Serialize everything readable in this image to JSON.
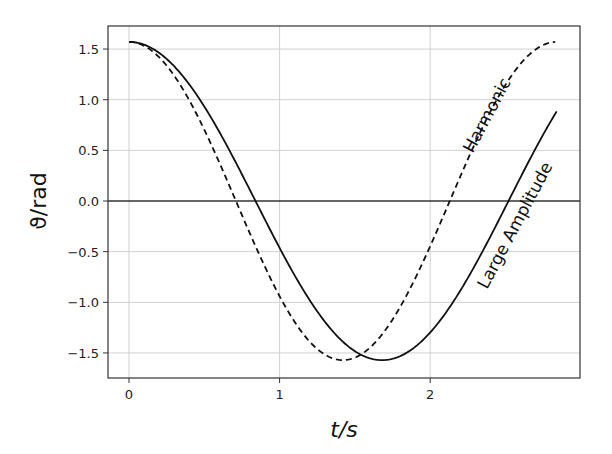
{
  "chart_data": {
    "type": "line",
    "title": "",
    "xlabel": "t/s",
    "ylabel": "ϑ/rad",
    "xlim": [
      -0.14,
      3.0
    ],
    "ylim": [
      -1.73,
      1.73
    ],
    "xticks": [
      0,
      1,
      2
    ],
    "xtick_labels": [
      "0",
      "1",
      "2"
    ],
    "yticks": [
      1.5,
      1.0,
      0.5,
      0.0,
      -0.5,
      -1.0,
      -1.5
    ],
    "ytick_labels": [
      "1.5",
      "1.0",
      "0.5",
      "0.0",
      "−0.5",
      "−1.0",
      "−1.5"
    ],
    "grid": true,
    "legend": "none (inline curve labels)",
    "annotations": [
      {
        "text": "Harmonic",
        "rotation_deg": -62,
        "near_series": "Harmonic"
      },
      {
        "text": "Large Amplitude",
        "rotation_deg": -62,
        "near_series": "Large Amplitude"
      }
    ],
    "horizontal_line": {
      "y": 0.0,
      "style": "solid"
    },
    "series": [
      {
        "name": "Harmonic",
        "style": "dashed",
        "color": "#111111",
        "x": [
          0.0,
          0.2,
          0.4,
          0.6,
          0.72,
          0.8,
          1.0,
          1.2,
          1.42,
          1.6,
          1.8,
          2.0,
          2.13,
          2.2,
          2.4,
          2.6,
          2.83
        ],
        "y": [
          1.57,
          1.48,
          1.0,
          0.38,
          0.0,
          -0.27,
          -0.89,
          -1.37,
          -1.57,
          -1.49,
          -1.13,
          -0.55,
          0.0,
          0.23,
          0.88,
          1.35,
          1.52
        ]
      },
      {
        "name": "Large Amplitude",
        "style": "solid",
        "color": "#111111",
        "x": [
          0.0,
          0.2,
          0.4,
          0.6,
          0.84,
          1.0,
          1.2,
          1.4,
          1.68,
          1.9,
          2.1,
          2.3,
          2.52,
          2.7,
          2.84
        ],
        "y": [
          1.57,
          1.51,
          1.22,
          0.77,
          0.0,
          -0.48,
          -1.02,
          -1.41,
          -1.57,
          -1.4,
          -0.98,
          -0.49,
          0.0,
          0.52,
          0.9
        ]
      }
    ]
  }
}
